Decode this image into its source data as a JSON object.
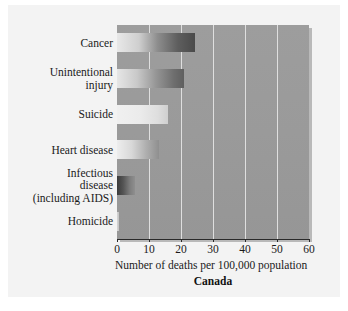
{
  "figure": {
    "country": "Canada",
    "xlabel": "Number of deaths per 100,000 population"
  },
  "chart_data": {
    "type": "bar",
    "orientation": "horizontal",
    "title": "",
    "subtitle": "Canada",
    "xlabel": "Number of deaths per 100,000 population",
    "ylabel": "",
    "xlim": [
      0,
      60
    ],
    "xticks": [
      "0",
      "10",
      "20",
      "30",
      "40",
      "50",
      "60"
    ],
    "xtick_values": [
      0,
      10,
      20,
      30,
      40,
      50,
      60
    ],
    "grid": true,
    "legend": false,
    "categories": [
      "Cancer",
      "Unintentional\ninjury",
      "Suicide",
      "Heart disease",
      "Infectious\ndisease\n(including AIDS)",
      "Homicide"
    ],
    "values": [
      24.5,
      21,
      16,
      13,
      5.5,
      0.7
    ],
    "bar_styles": [
      "dark",
      "mid",
      "light",
      "heart",
      "infect",
      "homicide"
    ]
  },
  "colors": {
    "plot_background": "#9a9a9a",
    "panel_background": "#f3f3f3",
    "gridline": "#ebebeb",
    "axis": "#2a2a2a",
    "text": "#1a1a1a"
  }
}
